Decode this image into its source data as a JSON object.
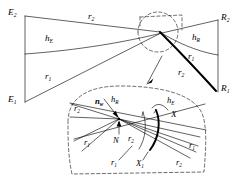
{
  "figure": {
    "type": "line-art-geometry-diagram",
    "stroke_color": "#000000",
    "background_color": "#ffffff"
  },
  "main_view": {
    "name": "main-ray-diagram",
    "labels": {
      "emitter_top": {
        "base": "E",
        "sub": "2"
      },
      "emitter_bottom": {
        "base": "E",
        "sub": "1"
      },
      "receiver_top": {
        "base": "R",
        "sub": "2"
      },
      "receiver_bottom": {
        "base": "R",
        "sub": "1"
      },
      "ray_top": {
        "base": "r",
        "sub": "2"
      },
      "ray_bottom": {
        "base": "r",
        "sub": "1"
      },
      "emitter_height": {
        "base": "h",
        "sub": "E"
      },
      "receiver_height": {
        "base": "h",
        "sub": "R"
      },
      "ray_right_upper": {
        "base": "r",
        "sub": "1"
      },
      "ray_right_lower": {
        "base": "r",
        "sub": "2"
      }
    }
  },
  "inset_view": {
    "name": "magnified-node-inset",
    "labels": {
      "node": {
        "base": "N",
        "sub": ""
      },
      "normal_vector": {
        "base": "n",
        "sub": "w"
      },
      "receiver_height": {
        "base": "h",
        "sub": "R"
      },
      "emitter_height": {
        "base": "h",
        "sub": "E"
      },
      "ray_left_upper": {
        "base": "r",
        "sub": "2"
      },
      "ray_left_lower": {
        "base": "r",
        "sub": "1"
      },
      "ray_center_upper": {
        "base": "r",
        "sub": "2"
      },
      "ray_center_lower": {
        "base": "r",
        "sub": "1"
      },
      "ray_right_upper": {
        "base": "r",
        "sub": "1"
      },
      "ray_right_lower": {
        "base": "r",
        "sub": "2"
      },
      "surface_patch": {
        "base": "X",
        "sub": ""
      },
      "surface_patch_sub": {
        "base": "X",
        "sub": "1"
      }
    }
  }
}
